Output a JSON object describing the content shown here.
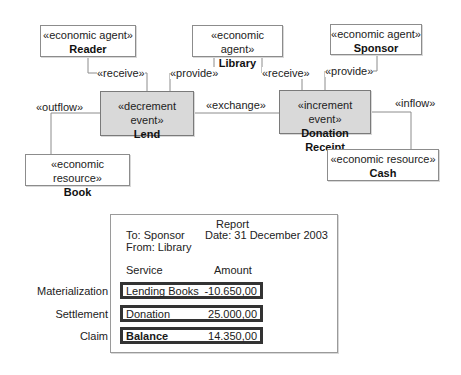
{
  "diagram": {
    "agents": [
      {
        "stereotype": "«economic agent»",
        "name": "Reader"
      },
      {
        "stereotype": "«economic agent»",
        "name": "Library"
      },
      {
        "stereotype": "«economic agent»",
        "name": "Sponsor"
      }
    ],
    "events": [
      {
        "stereotype": "«decrement event»",
        "name": "Lend"
      },
      {
        "stereotype": "«increment event»",
        "name": "Donation Receipt"
      }
    ],
    "resources": [
      {
        "stereotype": "«economic resource»",
        "name": "Book"
      },
      {
        "stereotype": "«economic resource»",
        "name": "Cash"
      }
    ],
    "associations": {
      "reader_lend": "«receive»",
      "library_lend": "«provide»",
      "library_donation": "«receive»",
      "sponsor_donation": "«provide»",
      "lend_book": "«outflow»",
      "donation_cash": "«inflow»",
      "exchange": "«exchange»"
    }
  },
  "report": {
    "title": "Report",
    "to": "To: Sponsor",
    "from": "From: Library",
    "date": "Date: 31 December 2003",
    "col_service": "Service",
    "col_amount": "Amount",
    "rows": [
      {
        "category": "Materialization",
        "service": "Lending Books",
        "amount": "-10.650,00"
      },
      {
        "category": "Settlement",
        "service": "Donation",
        "amount": "25.000,00"
      },
      {
        "category": "Claim",
        "service": "Balance",
        "amount": "14.350,00"
      }
    ]
  },
  "colors": {
    "event_fill": "#d9d9d9",
    "line": "#8c8c8c"
  }
}
